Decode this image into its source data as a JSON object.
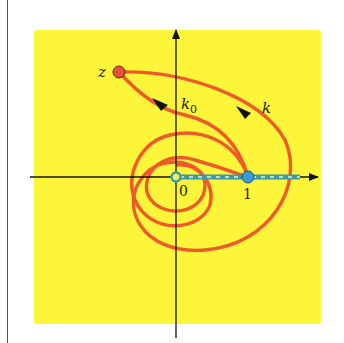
{
  "diagram": {
    "title": "",
    "colors": {
      "background": "#fdf53a",
      "curve": "#ee5a2a",
      "axis": "#111111",
      "segment": "#3a9aa8",
      "point_z": "#e8503a",
      "point_one": "#3a9ad6",
      "point_zero": "#f3ef6a"
    },
    "labels": {
      "z": "z",
      "k0": "k",
      "k0_sub": "0",
      "k": "k",
      "zero": "0",
      "one": "1"
    },
    "points": [
      {
        "name": "z",
        "description": "starting point z (red)"
      },
      {
        "name": "0",
        "description": "origin"
      },
      {
        "name": "1",
        "description": "point 1 on real axis (blue)"
      }
    ],
    "curves": [
      {
        "name": "k0",
        "description": "path from z to 1 winding around 0"
      },
      {
        "name": "k",
        "description": "path from z to 1 winding twice around 0"
      }
    ],
    "segment": {
      "from": "0",
      "to": "1",
      "style": "dashed branch cut along positive real axis"
    }
  }
}
